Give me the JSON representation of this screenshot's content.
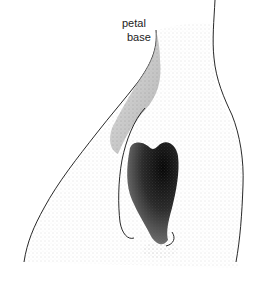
{
  "figure": {
    "type": "stippled botanical illustration",
    "labels": [
      {
        "text": "petal"
      },
      {
        "text": "base"
      }
    ],
    "colors": {
      "ink": "#111111",
      "background": "#ffffff"
    }
  }
}
